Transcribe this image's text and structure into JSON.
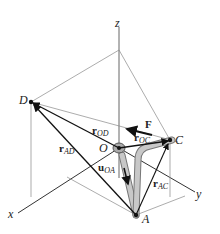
{
  "diagram": {
    "type": "3D position vector / force diagram",
    "axes": {
      "x": "x",
      "y": "y",
      "z": "z"
    },
    "points": {
      "D": "D",
      "O": "O",
      "C": "C",
      "A": "A"
    },
    "vectors": {
      "F": {
        "main": "F",
        "sub": ""
      },
      "r_OD": {
        "main": "r",
        "sub": "OD"
      },
      "r_OC": {
        "main": "r",
        "sub": "OC"
      },
      "r_AD": {
        "main": "r",
        "sub": "AD"
      },
      "r_AC": {
        "main": "r",
        "sub": "AC"
      },
      "u_OA": {
        "main": "u",
        "sub": "OA"
      }
    },
    "colors": {
      "line": "#222222",
      "guide": "#888888",
      "pipe": "#bdbdbd",
      "pipe_edge": "#777777"
    }
  }
}
